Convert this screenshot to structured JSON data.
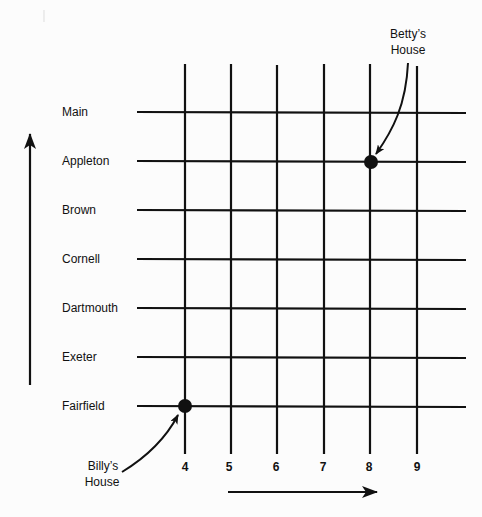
{
  "streets": [
    {
      "name": "Main",
      "y": 112
    },
    {
      "name": "Appleton",
      "y": 161
    },
    {
      "name": "Brown",
      "y": 210
    },
    {
      "name": "Cornell",
      "y": 259
    },
    {
      "name": "Dartmouth",
      "y": 308
    },
    {
      "name": "Exeter",
      "y": 357
    },
    {
      "name": "Fairfield",
      "y": 406
    }
  ],
  "avenues": [
    {
      "label": "4",
      "x": 185
    },
    {
      "label": "5",
      "x": 231
    },
    {
      "label": "6",
      "x": 277
    },
    {
      "label": "7",
      "x": 324
    },
    {
      "label": "8",
      "x": 370
    },
    {
      "label": "9",
      "x": 417
    }
  ],
  "houses": {
    "betty": {
      "line1": "Betty’s",
      "line2": "House",
      "street": "Appleton",
      "avenue": "8"
    },
    "billy": {
      "line1": "Billy’s",
      "line2": "House",
      "street": "Fairfield",
      "avenue": "4"
    }
  },
  "colors": {
    "ink": "#111111",
    "paper": "#fcfcfc"
  }
}
